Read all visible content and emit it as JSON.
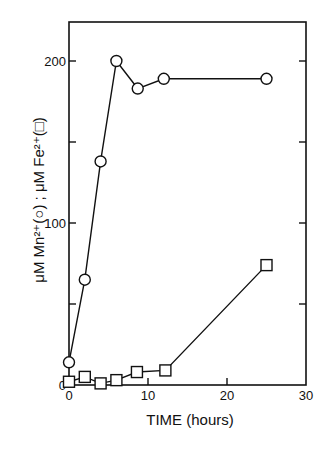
{
  "chart_data": {
    "type": "line",
    "title": "",
    "xlabel": "TIME (hours)",
    "ylabel": "μM Mn²⁺(○) ; μM Fe²⁺(□)",
    "xlim": [
      0,
      30
    ],
    "ylim": [
      0,
      225
    ],
    "x_ticks": [
      0,
      10,
      20,
      30
    ],
    "x_tick_labels": [
      "0",
      "10",
      "20",
      "30"
    ],
    "y_ticks": [
      0,
      50,
      100,
      150,
      200
    ],
    "y_tick_labels": [
      "0",
      "",
      "100",
      "",
      "200"
    ],
    "grid": false,
    "legend": "embedded in y-axis label (○ = Mn²⁺, □ = Fe²⁺)",
    "series": [
      {
        "name": "Mn2+",
        "marker": "circle",
        "x": [
          0,
          2,
          4,
          6,
          8.7,
          12,
          25
        ],
        "values": [
          14,
          65,
          138,
          200,
          183,
          189,
          189
        ]
      },
      {
        "name": "Fe2+",
        "marker": "square",
        "x": [
          0,
          2,
          4,
          6,
          8.6,
          12.2,
          25
        ],
        "values": [
          2,
          5,
          1,
          3,
          8,
          9,
          74
        ]
      }
    ]
  },
  "labels": {
    "xlabel": "TIME (hours)",
    "ylabel": "μM Mn²⁺(○) ; μM Fe²⁺(□)"
  }
}
